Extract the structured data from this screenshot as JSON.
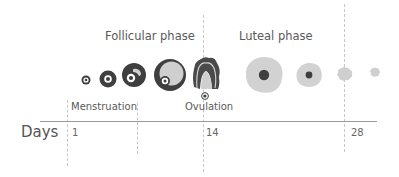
{
  "diagram": {
    "phases": [
      {
        "label": "Follicular phase"
      },
      {
        "label": "Luteal phase"
      }
    ],
    "events": {
      "menstruation": "Menstruation",
      "ovulation": "Ovulation"
    },
    "axis": {
      "label": "Days",
      "ticks": [
        "1",
        "14",
        "28"
      ]
    },
    "stages": [
      {
        "name": "primordial-follicle"
      },
      {
        "name": "primary-follicle"
      },
      {
        "name": "secondary-follicle"
      },
      {
        "name": "mature-follicle"
      },
      {
        "name": "ruptured-follicle"
      },
      {
        "name": "corpus-luteum"
      },
      {
        "name": "regressing-corpus-luteum"
      },
      {
        "name": "corpus-albicans"
      },
      {
        "name": "corpus-albicans-small"
      }
    ],
    "colors": {
      "dark": "#3f3f3f",
      "light": "#d0d0d0",
      "text": "#5a5a5a",
      "axis": "#9a9a9a",
      "dash": "#c8c8c8"
    }
  }
}
